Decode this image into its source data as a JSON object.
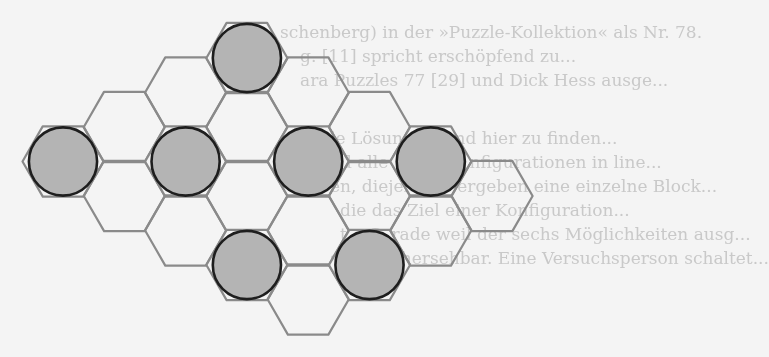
{
  "figure": {
    "cell_shape": "flat-top hexagon",
    "colors": {
      "background": "#f4f4f4",
      "hex_stroke": "#8a8a8a",
      "circle_fill": "#b4b4b4",
      "circle_stroke": "#1e1e1e",
      "ghost_text": "#c9c9c9"
    },
    "grid": {
      "origin_x": 63,
      "column_step": 61.3,
      "origin_y": 58,
      "half_row_step": 34.5,
      "radius": 40.5
    },
    "cells": [
      {
        "col": 0,
        "row": 3,
        "filled": true
      },
      {
        "col": 1,
        "row": 2,
        "filled": false
      },
      {
        "col": 1,
        "row": 4,
        "filled": false
      },
      {
        "col": 2,
        "row": 1,
        "filled": false
      },
      {
        "col": 2,
        "row": 3,
        "filled": true
      },
      {
        "col": 2,
        "row": 5,
        "filled": false
      },
      {
        "col": 3,
        "row": 0,
        "filled": true
      },
      {
        "col": 3,
        "row": 2,
        "filled": false
      },
      {
        "col": 3,
        "row": 4,
        "filled": false
      },
      {
        "col": 3,
        "row": 6,
        "filled": true
      },
      {
        "col": 4,
        "row": 1,
        "filled": false
      },
      {
        "col": 4,
        "row": 3,
        "filled": true
      },
      {
        "col": 4,
        "row": 5,
        "filled": false
      },
      {
        "col": 4,
        "row": 7,
        "filled": false
      },
      {
        "col": 5,
        "row": 2,
        "filled": false
      },
      {
        "col": 5,
        "row": 4,
        "filled": false
      },
      {
        "col": 5,
        "row": 6,
        "filled": true
      },
      {
        "col": 6,
        "row": 3,
        "filled": true
      },
      {
        "col": 6,
        "row": 5,
        "filled": false
      },
      {
        "col": 7,
        "row": 4,
        "filled": false
      }
    ]
  },
  "background_text": {
    "lines": [
      {
        "x": 280,
        "y": 20,
        "text": "schenberg) in der »Puzzle-Kollektion« als Nr. 78."
      },
      {
        "x": 300,
        "y": 44,
        "text": "g. [11] spricht erschöpfend zu..."
      },
      {
        "x": 300,
        "y": 68,
        "text": "ara Puzzles 77 [29] und Dick Hess ausge..."
      },
      {
        "x": 330,
        "y": 126,
        "text": "le Lösungen sind hier zu finden..."
      },
      {
        "x": 330,
        "y": 150,
        "text": "nd alle sechs Konfigurationen in line..."
      },
      {
        "x": 330,
        "y": 174,
        "text": "en, diejenigen ergeben eine einzelne Block..."
      },
      {
        "x": 340,
        "y": 198,
        "text": "die das Ziel einer Konfiguration..."
      },
      {
        "x": 340,
        "y": 222,
        "text": "ta. Gerade weil der sechs Möglichkeiten ausg..."
      },
      {
        "x": 330,
        "y": 246,
        "text": "st unvorhersehbar. Eine Versuchsperson schaltet..."
      }
    ]
  }
}
